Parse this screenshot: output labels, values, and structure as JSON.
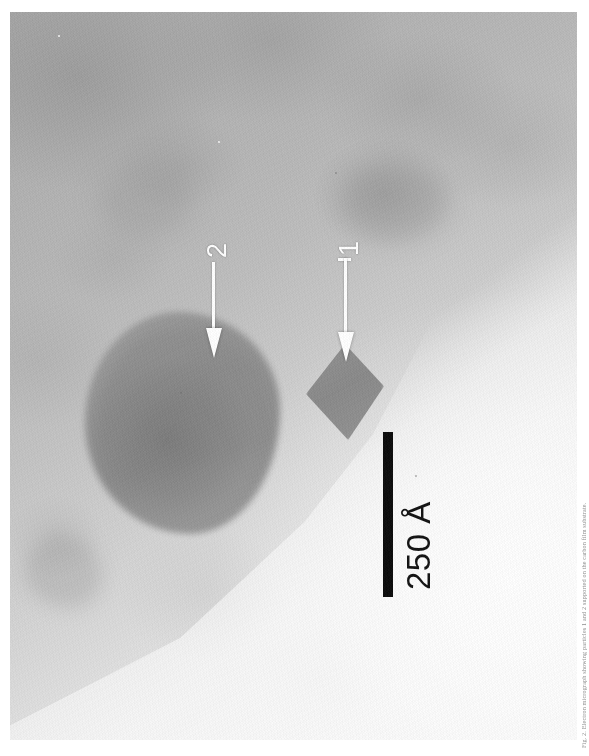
{
  "figure": {
    "kind": "tem-micrograph",
    "alt_description": "Transmission electron micrograph of two nanoparticles on an amorphous support film, rotated 90 degrees",
    "plate": {
      "x": 10,
      "y": 12,
      "width": 567,
      "height": 728,
      "background_hex": "#b9b9b9",
      "bright_region_hex": "#f0f0f0",
      "dark_region_hex": "#a9a9a9"
    },
    "caption_text": "Fig. 2. Electron micrograph showing particles 1 and 2 supported on the carbon film substrate."
  },
  "annotations": {
    "arrows": [
      {
        "id": "arrow-2",
        "label": "2",
        "label_color_hex": "#ffffff",
        "color_hex": "#ffffff",
        "points_to": "particle-2",
        "orientation": "down",
        "tip": {
          "x": 202,
          "y": 348
        }
      },
      {
        "id": "arrow-1",
        "label": "1",
        "label_color_hex": "#ffffff",
        "color_hex": "#ffffff",
        "points_to": "particle-1",
        "orientation": "down",
        "tip": {
          "x": 334,
          "y": 352
        }
      }
    ]
  },
  "particles": [
    {
      "id": "particle-1",
      "label": "1",
      "shape": "rhombic / cuboctahedral crystal",
      "fill_hex": "#8a8a8a",
      "bbox": {
        "x": 296,
        "y": 332,
        "width": 78,
        "height": 96
      }
    },
    {
      "id": "particle-2",
      "label": "2",
      "shape": "large rounded polygonal crystal",
      "fill_hex": "#909090",
      "bbox": {
        "x": 75,
        "y": 300,
        "width": 195,
        "height": 222
      }
    }
  ],
  "scale_bar": {
    "value": "250",
    "unit": "Å",
    "label": "250 Å",
    "color_hex": "#0a0a0a",
    "orientation": "vertical",
    "length_px": 165,
    "thickness_px": 10,
    "position": {
      "x": 373,
      "y": 420
    }
  },
  "colors": {
    "film_light": "#f0f0f0",
    "film_mid": "#c3c3c3",
    "film_dark": "#a9a9a9",
    "particle": "#8a8a8a",
    "annotation_white": "#ffffff",
    "scale_black": "#0a0a0a",
    "page_white": "#ffffff"
  }
}
